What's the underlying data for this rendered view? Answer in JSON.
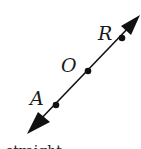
{
  "diagram": {
    "type": "line-with-points",
    "line": {
      "start": {
        "x": 28,
        "y": 133
      },
      "end": {
        "x": 140,
        "y": 15
      },
      "color": "#111111",
      "arrowheads": [
        "start",
        "end"
      ]
    },
    "points": [
      {
        "label": "R",
        "x": 122,
        "y": 38,
        "label_x": 98,
        "label_y": 40
      },
      {
        "label": "O",
        "x": 88,
        "y": 71,
        "label_x": 61,
        "label_y": 72
      },
      {
        "label": "A",
        "x": 56,
        "y": 105,
        "label_x": 30,
        "label_y": 105
      }
    ],
    "cut_off_text": "straight"
  }
}
